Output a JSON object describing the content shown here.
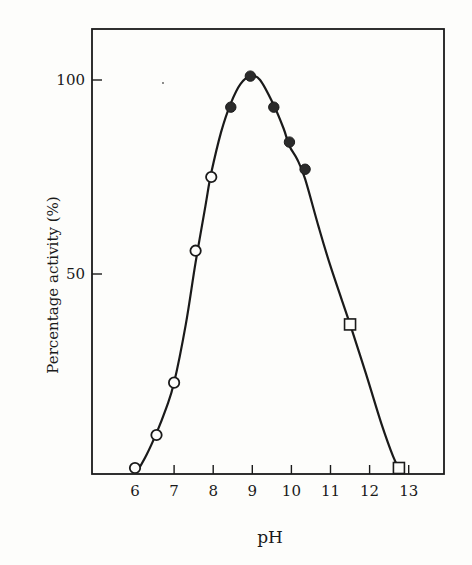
{
  "chart_data": {
    "type": "scatter",
    "title": "",
    "xlabel": "pH",
    "ylabel": "Percentage activity (%)",
    "xlim": [
      5.6,
      13.9
    ],
    "ylim": [
      -1.5,
      114
    ],
    "x_ticks": [
      6,
      7,
      8,
      9,
      10,
      11,
      12,
      13
    ],
    "x_tick_labels": [
      "6",
      "7",
      "8",
      "9",
      "10",
      "11",
      "12",
      "13"
    ],
    "y_ticks": [
      50,
      100
    ],
    "y_tick_labels": [
      "50",
      "100"
    ],
    "grid": false,
    "legend": null,
    "series": [
      {
        "name": "open-circles",
        "marker": "circle-open",
        "x": [
          6.0,
          6.55,
          7.0,
          7.55,
          7.95
        ],
        "y": [
          0,
          8.5,
          22,
          56,
          75
        ]
      },
      {
        "name": "filled-circles",
        "marker": "circle-filled",
        "x": [
          8.45,
          8.95,
          9.55,
          9.95,
          10.35
        ],
        "y": [
          93,
          101,
          93,
          84,
          77
        ]
      },
      {
        "name": "open-squares",
        "marker": "square-open",
        "x": [
          11.5,
          12.75
        ],
        "y": [
          37,
          0
        ]
      }
    ],
    "fitted_curve": {
      "name": "smooth-fit",
      "x": [
        6.05,
        6.3,
        6.55,
        6.8,
        7.0,
        7.3,
        7.55,
        7.8,
        7.95,
        8.2,
        8.45,
        8.7,
        8.95,
        9.2,
        9.55,
        9.8,
        9.95,
        10.15,
        10.35,
        10.7,
        11.0,
        11.5,
        11.9,
        12.3,
        12.6,
        12.75
      ],
      "y": [
        -1.0,
        3.5,
        9.0,
        15.5,
        22.0,
        37.0,
        53.0,
        67.5,
        76.0,
        86.5,
        94.0,
        99.0,
        101.0,
        100.0,
        93.5,
        87.5,
        83.0,
        79.5,
        74.5,
        62.0,
        52.0,
        37.0,
        24.5,
        11.5,
        3.0,
        0.0
      ]
    }
  }
}
